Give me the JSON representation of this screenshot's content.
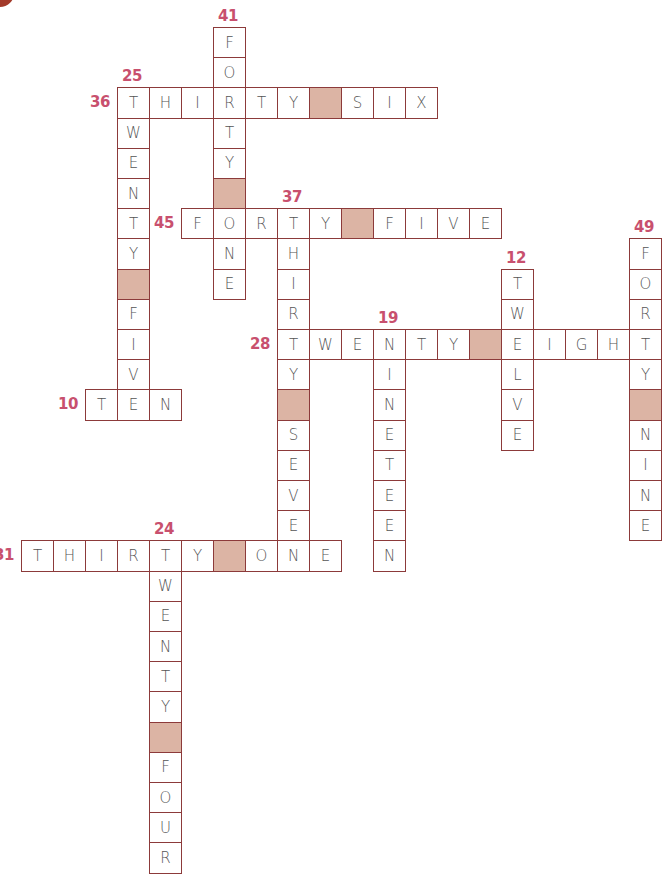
{
  "puzzle": {
    "type": "number-words crossword",
    "grid": {
      "origin_x": 21,
      "origin_y": 27,
      "cell_w": 32,
      "cell_h": 30.2
    },
    "colors": {
      "border": "#8c3a3a",
      "clue_number": "#c8506e",
      "blank_cell": "#dcb4a4",
      "letter": "#555555",
      "corner_dot": "#a33a2a"
    },
    "entries": [
      {
        "number": "41",
        "answer": "FORTY ONE",
        "direction": "down",
        "row": 0,
        "col": 6,
        "cells": [
          "F",
          "O",
          "R",
          "T",
          "Y",
          "",
          "O",
          "N",
          "E"
        ]
      },
      {
        "number": "25",
        "answer": "TWENTY FIVE",
        "direction": "down",
        "row": 2,
        "col": 3,
        "cells": [
          "T",
          "W",
          "E",
          "N",
          "T",
          "Y",
          "",
          "F",
          "I",
          "V",
          "E"
        ]
      },
      {
        "number": "36",
        "answer": "THIRTY SIX",
        "direction": "across",
        "row": 2,
        "col": 3,
        "cells": [
          "T",
          "H",
          "I",
          "R",
          "T",
          "Y",
          "",
          "S",
          "I",
          "X"
        ]
      },
      {
        "number": "37",
        "answer": "THIRTY SEVEN",
        "direction": "down",
        "row": 6,
        "col": 8,
        "cells": [
          "T",
          "H",
          "I",
          "R",
          "T",
          "Y",
          "",
          "S",
          "E",
          "V",
          "E",
          "N"
        ]
      },
      {
        "number": "45",
        "answer": "FORTY FIVE",
        "direction": "across",
        "row": 6,
        "col": 5,
        "cells": [
          "F",
          "O",
          "R",
          "T",
          "Y",
          "",
          "F",
          "I",
          "V",
          "E"
        ]
      },
      {
        "number": "49",
        "answer": "FORTY NINE",
        "direction": "down",
        "row": 7,
        "col": 19,
        "cells": [
          "F",
          "O",
          "R",
          "T",
          "Y",
          "",
          "N",
          "I",
          "N",
          "E"
        ]
      },
      {
        "number": "12",
        "answer": "TWELVE",
        "direction": "down",
        "row": 8,
        "col": 15,
        "cells": [
          "T",
          "W",
          "E",
          "L",
          "V",
          "E"
        ]
      },
      {
        "number": "19",
        "answer": "NINETEEN",
        "direction": "down",
        "row": 10,
        "col": 11,
        "cells": [
          "N",
          "I",
          "N",
          "E",
          "T",
          "E",
          "E",
          "N"
        ]
      },
      {
        "number": "28",
        "answer": "TWENTY EIGHT",
        "direction": "across",
        "row": 10,
        "col": 8,
        "cells": [
          "T",
          "W",
          "E",
          "N",
          "T",
          "Y",
          "",
          "E",
          "I",
          "G",
          "H",
          "T"
        ]
      },
      {
        "number": "10",
        "answer": "TEN",
        "direction": "across",
        "row": 12,
        "col": 2,
        "cells": [
          "T",
          "E",
          "N"
        ]
      },
      {
        "number": "24",
        "answer": "TWENTY FOUR",
        "direction": "down",
        "row": 17,
        "col": 4,
        "cells": [
          "T",
          "W",
          "E",
          "N",
          "T",
          "Y",
          "",
          "F",
          "O",
          "U",
          "R"
        ]
      },
      {
        "number": "31",
        "answer": "THIRTY ONE",
        "direction": "across",
        "row": 17,
        "col": 0,
        "cells": [
          "T",
          "H",
          "I",
          "R",
          "T",
          "Y",
          "",
          "O",
          "N",
          "E"
        ]
      }
    ]
  }
}
